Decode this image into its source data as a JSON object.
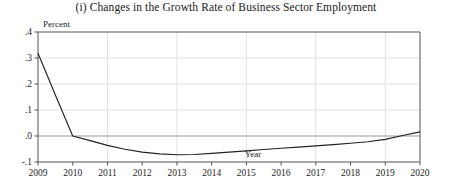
{
  "chart_data": {
    "type": "line",
    "title": "(i)  Changes in the Growth Rate of Business Sector Employment",
    "xlabel": "Year",
    "ylabel": "Percent",
    "xlim": [
      2009,
      2020
    ],
    "ylim": [
      -0.1,
      0.4
    ],
    "grid": true,
    "legend": "none",
    "ytick_values": [
      0.4,
      0.3,
      0.2,
      0.1,
      0.0,
      -0.1
    ],
    "ytick_labels": [
      ".4",
      ".3",
      ".2",
      ".1",
      ".0",
      "-.1"
    ],
    "xtick_values": [
      2009,
      2010,
      2011,
      2012,
      2013,
      2014,
      2015,
      2016,
      2017,
      2018,
      2019,
      2020
    ],
    "xtick_labels": [
      "2009",
      "2010",
      "2011",
      "2012",
      "2013",
      "2014",
      "2015",
      "2016",
      "2017",
      "2018",
      "2019",
      "2020"
    ],
    "vertical_gridline_years": [
      2011,
      2013,
      2015,
      2017,
      2019
    ],
    "zero_line_value": 0.0,
    "line_color": "#222222",
    "grid_color": "#e2e2e2",
    "axis_color": "#555555",
    "zero_line_color": "#9a9a9a",
    "series": [
      {
        "name": "Change in growth rate of business sector employment",
        "x": [
          2009,
          2009.5,
          2010,
          2010.5,
          2011,
          2011.5,
          2012,
          2012.5,
          2013,
          2013.5,
          2014,
          2014.5,
          2015,
          2015.5,
          2016,
          2016.5,
          2017,
          2017.5,
          2018,
          2018.5,
          2019,
          2019.5,
          2020
        ],
        "values": [
          0.318,
          0.158,
          0.0,
          -0.018,
          -0.036,
          -0.051,
          -0.062,
          -0.069,
          -0.072,
          -0.071,
          -0.067,
          -0.062,
          -0.057,
          -0.052,
          -0.047,
          -0.043,
          -0.038,
          -0.033,
          -0.028,
          -0.022,
          -0.013,
          0.002,
          0.016
        ]
      }
    ]
  }
}
